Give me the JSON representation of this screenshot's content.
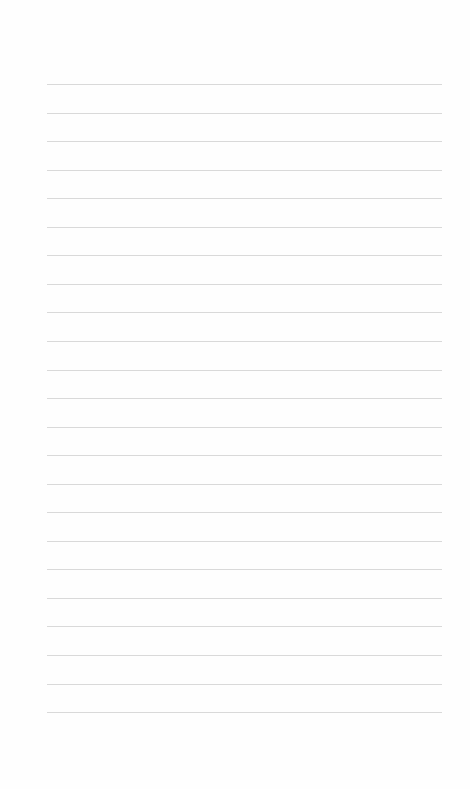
{
  "page": {
    "type": "blank lined paper",
    "line_count": 23,
    "first_line_y": 84,
    "line_spacing": 28.55,
    "line_left": 47,
    "line_right": 442,
    "line_color": "#d9d9d9",
    "background_color": "#fefefe"
  }
}
